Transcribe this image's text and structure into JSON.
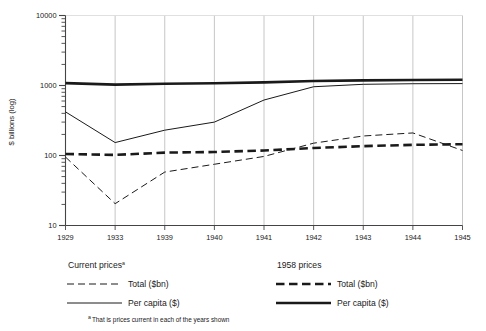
{
  "chart_data": {
    "type": "line",
    "title": "",
    "xlabel": "",
    "ylabel": "$ billions (log)",
    "x": [
      "1929",
      "1933",
      "1939",
      "1940",
      "1941",
      "1942",
      "1943",
      "1944",
      "1945"
    ],
    "categories": [
      "1929",
      "1933",
      "1939",
      "1940",
      "1941",
      "1942",
      "1943",
      "1944",
      "1945"
    ],
    "yscale": "log",
    "ylim": [
      10,
      10000
    ],
    "ytick_labels": [
      "10000",
      "1000",
      "100",
      "10"
    ],
    "ytick_values": [
      10000,
      1000,
      100,
      10
    ],
    "grid": "vertical",
    "legend_position": "below-plot",
    "series": [
      {
        "name": "Current prices - Total ($bn)",
        "group": "Current prices",
        "label": "Total ($bn)",
        "style": "thin-dashed",
        "values": [
          95,
          20.5,
          58,
          75,
          97,
          150,
          190,
          210,
          118
        ]
      },
      {
        "name": "Current prices - Per capita ($)",
        "group": "Current prices",
        "label": "Per capita ($)",
        "style": "thin-solid",
        "values": [
          420,
          153,
          230,
          300,
          620,
          960,
          1040,
          1060,
          1065
        ]
      },
      {
        "name": "1958 prices - Total ($bn)",
        "group": "1958 prices",
        "label": "Total ($bn)",
        "style": "thick-dashed",
        "values": [
          105,
          102,
          110,
          112,
          118,
          128,
          136,
          142,
          145
        ]
      },
      {
        "name": "1958 prices - Per capita ($)",
        "group": "1958 prices",
        "label": "Per capita ($)",
        "style": "thick-solid",
        "values": [
          1080,
          1030,
          1060,
          1075,
          1110,
          1160,
          1185,
          1200,
          1210
        ]
      }
    ]
  },
  "axis": {
    "y_title": "$ billions (log)",
    "y_labels": [
      "10000",
      "1000",
      "100",
      "10"
    ],
    "x_labels": [
      "1929",
      "1933",
      "1939",
      "1940",
      "1941",
      "1942",
      "1943",
      "1944",
      "1945"
    ]
  },
  "legend": {
    "left": {
      "heading": "Current prices",
      "heading_sup": "a",
      "items": [
        {
          "label": "Total ($bn)",
          "style": "thin-dashed"
        },
        {
          "label": "Per capita ($)",
          "style": "thin-solid"
        }
      ]
    },
    "right": {
      "heading": "1958 prices",
      "heading_sup": "",
      "items": [
        {
          "label": "Total ($bn)",
          "style": "thick-dashed"
        },
        {
          "label": "Per capita ($)",
          "style": "thick-solid"
        }
      ]
    }
  },
  "footnote": {
    "marker": "a",
    "text": "That is prices current in each of the years shown"
  },
  "colors": {
    "ink": "#1a1a1a",
    "grid": "#b8b8b8",
    "axis": "#555555",
    "background": "#ffffff"
  }
}
